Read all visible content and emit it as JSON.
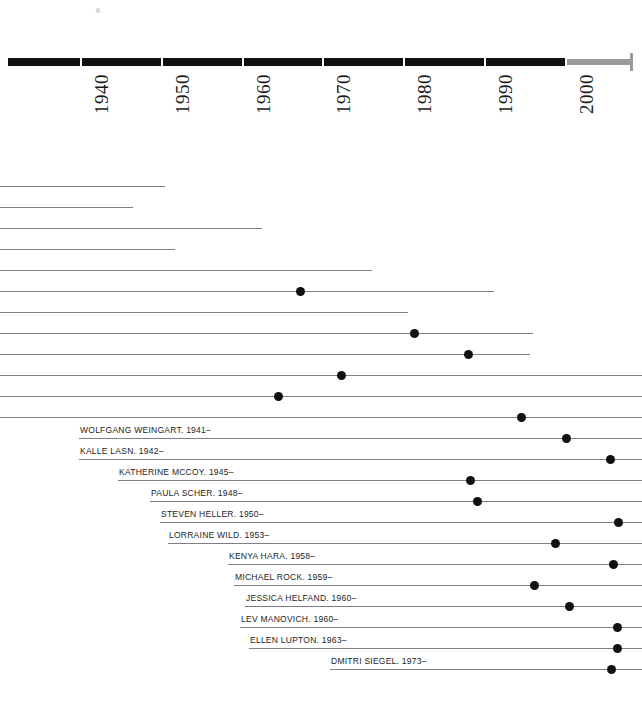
{
  "figure": {
    "kind": "historical-timeline",
    "orientation": "horizontal",
    "background_color": "#ffffff",
    "line_color": "#7e7e84",
    "dot_color": "#111111",
    "axis_color": "#111111",
    "axis_tail_color": "#9b9b9b"
  },
  "chart_data": {
    "type": "timeline",
    "title": "",
    "xlabel": "",
    "ylabel": "",
    "xlim": [
      1934,
      2009
    ],
    "grid": false,
    "legend": null,
    "axis": {
      "tick_labels": [
        "1940",
        "1950",
        "1960",
        "1970",
        "1980",
        "1990",
        "2000"
      ],
      "tick_values": [
        1940,
        1950,
        1960,
        1970,
        1980,
        1990,
        2000
      ],
      "tick_label_rotation": -90,
      "bar_start_year": 1931,
      "bar_end_year": 2000,
      "tail_end_year": 2008
    },
    "rows": [
      {
        "label": "",
        "labeled": false,
        "start_x": 0,
        "end_x": 165,
        "dot_x": null,
        "y": 186
      },
      {
        "label": "",
        "labeled": false,
        "start_x": 0,
        "end_x": 133,
        "dot_x": null,
        "y": 207
      },
      {
        "label": "",
        "labeled": false,
        "start_x": 0,
        "end_x": 262,
        "dot_x": null,
        "y": 228
      },
      {
        "label": "",
        "labeled": false,
        "start_x": 0,
        "end_x": 175,
        "dot_x": null,
        "y": 249
      },
      {
        "label": "",
        "labeled": false,
        "start_x": 0,
        "end_x": 372,
        "dot_x": null,
        "y": 270
      },
      {
        "label": "",
        "labeled": false,
        "start_x": 0,
        "end_x": 494,
        "dot_x": 300,
        "y": 291
      },
      {
        "label": "",
        "labeled": false,
        "start_x": 0,
        "end_x": 408,
        "dot_x": null,
        "y": 312
      },
      {
        "label": "",
        "labeled": false,
        "start_x": 0,
        "end_x": 533,
        "dot_x": 414,
        "y": 333
      },
      {
        "label": "",
        "labeled": false,
        "start_x": 0,
        "end_x": 530,
        "dot_x": 468,
        "y": 354
      },
      {
        "label": "",
        "labeled": false,
        "start_x": 0,
        "end_x": 642,
        "dot_x": 341,
        "y": 375
      },
      {
        "label": "",
        "labeled": false,
        "start_x": 0,
        "end_x": 642,
        "dot_x": 278,
        "y": 396
      },
      {
        "label": "",
        "labeled": false,
        "start_x": 0,
        "end_x": 642,
        "dot_x": 521,
        "y": 417
      },
      {
        "label": "WOLFGANG WEINGART. 1941–",
        "labeled": true,
        "start_x": 79,
        "end_x": 642,
        "dot_x": 566,
        "y": 438
      },
      {
        "label": "KALLE LASN. 1942–",
        "labeled": true,
        "start_x": 79,
        "end_x": 642,
        "dot_x": 610,
        "y": 459
      },
      {
        "label": "KATHERINE MCCOY. 1945–",
        "labeled": true,
        "start_x": 118,
        "end_x": 642,
        "dot_x": 470,
        "y": 480
      },
      {
        "label": "PAULA SCHER. 1948–",
        "labeled": true,
        "start_x": 150,
        "end_x": 642,
        "dot_x": 477,
        "y": 501
      },
      {
        "label": "STEVEN HELLER. 1950–",
        "labeled": true,
        "start_x": 160,
        "end_x": 642,
        "dot_x": 618,
        "y": 522
      },
      {
        "label": "LORRAINE WILD. 1953–",
        "labeled": true,
        "start_x": 168,
        "end_x": 642,
        "dot_x": 555,
        "y": 543
      },
      {
        "label": "KENYA HARA. 1958–",
        "labeled": true,
        "start_x": 228,
        "end_x": 642,
        "dot_x": 613,
        "y": 564
      },
      {
        "label": "MICHAEL ROCK. 1959–",
        "labeled": true,
        "start_x": 234,
        "end_x": 642,
        "dot_x": 534,
        "y": 585
      },
      {
        "label": "JESSICA HELFAND. 1960–",
        "labeled": true,
        "start_x": 245,
        "end_x": 642,
        "dot_x": 569,
        "y": 606
      },
      {
        "label": "LEV MANOVICH. 1960–",
        "labeled": true,
        "start_x": 240,
        "end_x": 642,
        "dot_x": 617,
        "y": 627
      },
      {
        "label": "ELLEN LUPTON. 1963–",
        "labeled": true,
        "start_x": 249,
        "end_x": 642,
        "dot_x": 617,
        "y": 648
      },
      {
        "label": "DMITRI SIEGEL. 1973–",
        "labeled": true,
        "start_x": 330,
        "end_x": 642,
        "dot_x": 611,
        "y": 669
      }
    ]
  }
}
